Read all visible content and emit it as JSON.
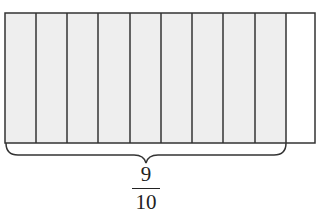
{
  "diagram": {
    "type": "fraction-bar",
    "total_parts": 10,
    "shaded_parts": 9,
    "shaded_color": "#eeeeee",
    "unshaded_color": "#ffffff",
    "line_color": "#333333",
    "label": {
      "numerator": "9",
      "denominator": "10"
    }
  }
}
